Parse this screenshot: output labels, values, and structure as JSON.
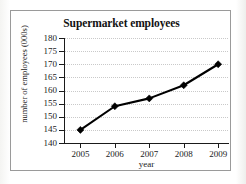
{
  "figure": {
    "title": "Supermarket employees"
  },
  "chart_data": {
    "type": "line",
    "title": "Supermarket employees",
    "xlabel": "year",
    "ylabel": "number of employees (000s)",
    "categories": [
      "2005",
      "2006",
      "2007",
      "2008",
      "2009"
    ],
    "x": [
      2005,
      2006,
      2007,
      2008,
      2009
    ],
    "values": [
      145,
      154,
      157,
      162,
      170
    ],
    "series": [
      {
        "name": "number of employees (000s)",
        "values": [
          145,
          154,
          157,
          162,
          170
        ]
      }
    ],
    "ylim": [
      140,
      180
    ],
    "ytick_labels": [
      "180",
      "175",
      "170",
      "165",
      "160",
      "155",
      "150",
      "145",
      "140"
    ],
    "ytick_values": [
      180,
      175,
      170,
      165,
      160,
      155,
      150,
      145,
      140
    ],
    "ytick_step": 5,
    "xtick_labels": [
      "2005",
      "2006",
      "2007",
      "2008",
      "2009"
    ],
    "grid": "horizontal-dotted",
    "legend": "none",
    "marker": "diamond",
    "line_color": "#000000",
    "marker_color": "#000000",
    "grid_color": "#c9c9c9",
    "axis_color": "#1a1a1a",
    "background_color": "#ffffff"
  }
}
